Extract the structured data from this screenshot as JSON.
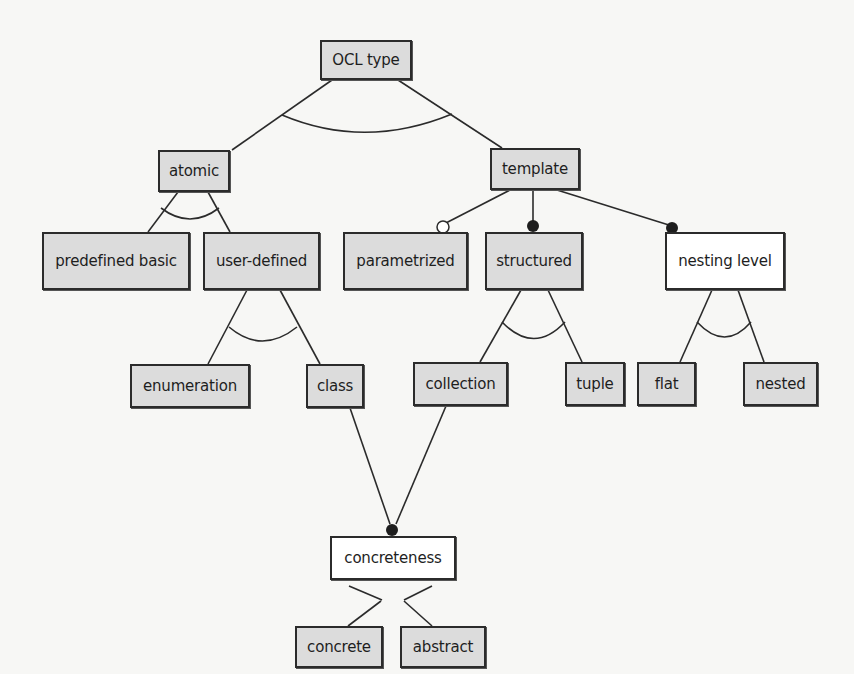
{
  "diagram": {
    "type": "feature-model",
    "nodes": [
      {
        "id": "ocl_type",
        "label": "OCL type",
        "style": "gray",
        "x": 320,
        "y": 40,
        "w": 92,
        "h": 40
      },
      {
        "id": "atomic",
        "label": "atomic",
        "style": "gray",
        "x": 158,
        "y": 150,
        "w": 72,
        "h": 42
      },
      {
        "id": "template",
        "label": "template",
        "style": "gray",
        "x": 490,
        "y": 148,
        "w": 90,
        "h": 42
      },
      {
        "id": "predefined_basic",
        "label": "predefined basic",
        "style": "gray",
        "x": 42,
        "y": 232,
        "w": 148,
        "h": 58
      },
      {
        "id": "user_defined",
        "label": "user-defined",
        "style": "gray",
        "x": 203,
        "y": 232,
        "w": 117,
        "h": 58
      },
      {
        "id": "parametrized",
        "label": "parametrized",
        "style": "gray",
        "x": 343,
        "y": 232,
        "w": 125,
        "h": 58
      },
      {
        "id": "structured",
        "label": "structured",
        "style": "gray",
        "x": 485,
        "y": 232,
        "w": 98,
        "h": 58
      },
      {
        "id": "nesting_level",
        "label": "nesting level",
        "style": "white",
        "x": 665,
        "y": 232,
        "w": 120,
        "h": 58
      },
      {
        "id": "enumeration",
        "label": "enumeration",
        "style": "gray",
        "x": 130,
        "y": 364,
        "w": 120,
        "h": 44
      },
      {
        "id": "class",
        "label": "class",
        "style": "gray",
        "x": 306,
        "y": 364,
        "w": 58,
        "h": 44
      },
      {
        "id": "collection",
        "label": "collection",
        "style": "gray",
        "x": 413,
        "y": 362,
        "w": 95,
        "h": 44
      },
      {
        "id": "tuple",
        "label": "tuple",
        "style": "gray",
        "x": 565,
        "y": 362,
        "w": 60,
        "h": 44
      },
      {
        "id": "flat",
        "label": "flat",
        "style": "gray",
        "x": 637,
        "y": 362,
        "w": 59,
        "h": 44
      },
      {
        "id": "nested",
        "label": "nested",
        "style": "gray",
        "x": 743,
        "y": 362,
        "w": 75,
        "h": 44
      },
      {
        "id": "concreteness",
        "label": "concreteness",
        "style": "white",
        "x": 330,
        "y": 540,
        "w": 126,
        "h": 60
      },
      {
        "id": "concrete",
        "label": "concrete",
        "style": "gray",
        "x": 295,
        "y": 586,
        "w": 88,
        "h": 44
      },
      {
        "id": "abstract",
        "label": "abstract",
        "style": "gray",
        "x": 400,
        "y": 586,
        "w": 86,
        "h": 44
      }
    ],
    "edges": [
      {
        "from": "ocl_type",
        "to": "atomic",
        "group": "xor_root"
      },
      {
        "from": "ocl_type",
        "to": "template",
        "group": "xor_root"
      },
      {
        "from": "atomic",
        "to": "predefined_basic",
        "group": "xor_atomic"
      },
      {
        "from": "atomic",
        "to": "user_defined",
        "group": "xor_atomic"
      },
      {
        "from": "template",
        "to": "parametrized",
        "marker": "optional"
      },
      {
        "from": "template",
        "to": "structured",
        "marker": "mandatory"
      },
      {
        "from": "template",
        "to": "nesting_level",
        "marker": "mandatory"
      },
      {
        "from": "user_defined",
        "to": "enumeration",
        "group": "xor_user"
      },
      {
        "from": "user_defined",
        "to": "class",
        "group": "xor_user"
      },
      {
        "from": "structured",
        "to": "collection",
        "group": "xor_struct"
      },
      {
        "from": "structured",
        "to": "tuple",
        "group": "xor_struct"
      },
      {
        "from": "nesting_level",
        "to": "flat",
        "group": "xor_nest"
      },
      {
        "from": "nesting_level",
        "to": "nested",
        "group": "xor_nest"
      },
      {
        "from": "class",
        "to": "concreteness",
        "marker": "mandatory"
      },
      {
        "from": "collection",
        "to": "concreteness",
        "marker": "mandatory"
      },
      {
        "from": "concreteness",
        "to": "concrete",
        "group": "xor_concrete"
      },
      {
        "from": "concreteness",
        "to": "abstract",
        "group": "xor_concrete"
      }
    ],
    "legend_semantics": {
      "arc": "alternative (xor) group",
      "filled_circle": "mandatory feature",
      "hollow_circle": "optional feature"
    },
    "colors": {
      "gray_fill": "#dcdcdc",
      "white_fill": "#ffffff",
      "stroke": "#2b2b2b",
      "background": "#f7f7f5"
    }
  }
}
